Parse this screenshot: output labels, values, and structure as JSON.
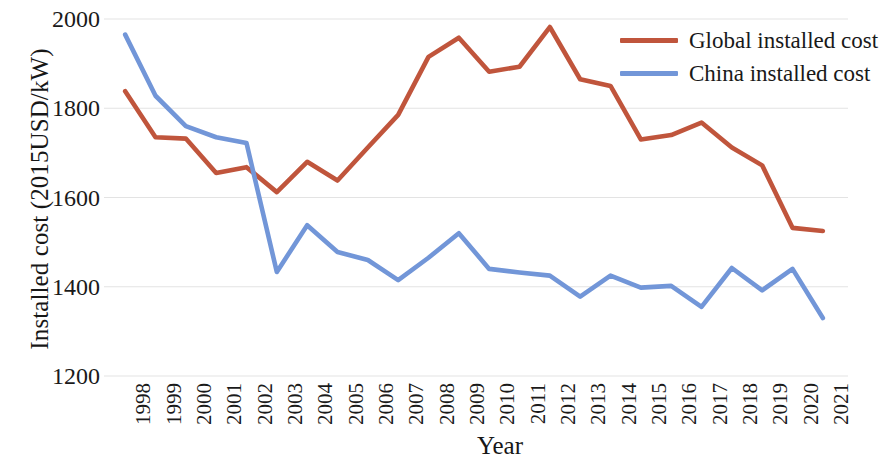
{
  "chart_data": {
    "type": "line",
    "title": "",
    "xlabel": "Year",
    "ylabel": "Installed cost (2015USD/kW)",
    "x": [
      1998,
      1999,
      2000,
      2001,
      2002,
      2003,
      2004,
      2005,
      2006,
      2007,
      2008,
      2009,
      2010,
      2011,
      2012,
      2013,
      2014,
      2015,
      2016,
      2017,
      2018,
      2019,
      2020,
      2021
    ],
    "xtick_labels": [
      "1998",
      "1999",
      "2000",
      "2001",
      "2002",
      "2003",
      "2004",
      "2005",
      "2006",
      "2007",
      "2008",
      "2009",
      "2010",
      "2011",
      "2012",
      "2013",
      "2014",
      "2015",
      "2016",
      "2017",
      "2018",
      "2019",
      "2020",
      "2021"
    ],
    "ytick_labels": [
      "2000",
      "1800",
      "1600",
      "1400",
      "1200"
    ],
    "yticks": [
      2000,
      1800,
      1600,
      1400,
      1200
    ],
    "ylim": [
      1200,
      2000
    ],
    "grid": true,
    "grid_axis": "y",
    "legend_position": "top-right",
    "series": [
      {
        "name": "Global installed cost",
        "color": "#c0553c",
        "values": [
          1838,
          1735,
          1732,
          1655,
          1668,
          1612,
          1680,
          1638,
          1712,
          1785,
          1915,
          1958,
          1882,
          1893,
          1982,
          1865,
          1850,
          1730,
          1740,
          1768,
          1712,
          1672,
          1532,
          1525
        ]
      },
      {
        "name": "China installed cost",
        "color": "#7296d8",
        "values": [
          1965,
          1828,
          1760,
          1735,
          1722,
          1433,
          1538,
          1478,
          1460,
          1415,
          1465,
          1520,
          1440,
          1432,
          1425,
          1378,
          1425,
          1398,
          1402,
          1355,
          1442,
          1392,
          1440,
          1330
        ]
      }
    ]
  },
  "legend": {
    "items": [
      {
        "label": "Global installed cost",
        "color": "#c0553c"
      },
      {
        "label": "China installed cost",
        "color": "#7296d8"
      }
    ]
  },
  "axes": {
    "y_title": "Installed cost (2015USD/kW)",
    "x_title": "Year"
  },
  "colors": {
    "global": "#c0553c",
    "china": "#7296d8",
    "grid": "#e3e3e3",
    "text": "#1a1a1a",
    "background": "#ffffff"
  }
}
